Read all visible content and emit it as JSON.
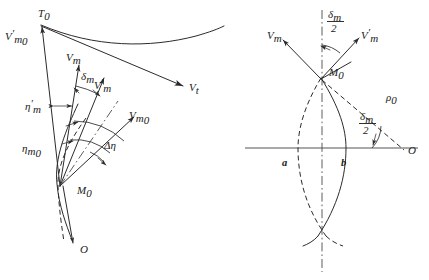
{
  "figure": {
    "ink_color": "#2b2b2b",
    "axis_color": "#555555",
    "background": "#ffffff"
  },
  "left_panel": {
    "name": "velocity-vector-panel",
    "labels": {
      "apex": {
        "base": "T",
        "sub": "0"
      },
      "vm0_prime": {
        "base": "V",
        "prime": "′",
        "sub": "m",
        "subsub": "0"
      },
      "vm": {
        "base": "V",
        "sub": "m"
      },
      "vm_prime": {
        "base": "V",
        "prime": "′",
        "sub": "m"
      },
      "vm0": {
        "base": "V",
        "sub": "m",
        "subsub": "0"
      },
      "vt": {
        "base": "V",
        "sub": "t"
      },
      "delta_m": {
        "base": "δ",
        "sub": "m"
      },
      "eta_m_prime": {
        "base": "η",
        "prime": "′",
        "sub": "m"
      },
      "eta_m0": {
        "base": "η",
        "sub": "m",
        "subsub": "0"
      },
      "delta_eta": {
        "base": "Δη"
      },
      "origin_m0": {
        "base": "M",
        "sub": "0"
      },
      "origin_o": {
        "base": "O"
      }
    }
  },
  "right_panel": {
    "name": "trajectory-envelope-panel",
    "labels": {
      "vm": {
        "base": "V",
        "sub": "m"
      },
      "vm_prime": {
        "base": "V",
        "prime": "′",
        "sub": "m"
      },
      "delta_m_half_num": {
        "base": "δ",
        "sub": "m"
      },
      "delta_m_half_den": {
        "base": "2"
      },
      "m0": {
        "base": "M",
        "sub": "0"
      },
      "rho_0": {
        "base": "ρ",
        "sub": "0"
      },
      "arc_a": {
        "base": "a"
      },
      "arc_b": {
        "base": "b"
      },
      "center_o": {
        "base": "O"
      }
    }
  }
}
